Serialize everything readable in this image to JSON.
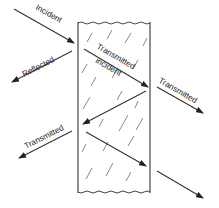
{
  "diagram": {
    "colors": {
      "line": "#333333",
      "text": "#222222",
      "background": "#ffffff"
    },
    "slab": {
      "x1": 78,
      "x2": 150,
      "top": 22,
      "bottom": 193
    },
    "labels": {
      "incident": "Incident",
      "reflected": "Reflected",
      "transmitted_incident_line1": "Transmitted",
      "transmitted_incident_line2": "incident",
      "transmitted_right": "Transmitted",
      "transmitted_left": "Transmitted"
    },
    "arrows": [
      {
        "name": "incident-ray",
        "from": [
          14,
          9
        ],
        "to": [
          74,
          43
        ]
      },
      {
        "name": "reflected-ray",
        "from": [
          72,
          51
        ],
        "to": [
          12,
          82
        ]
      },
      {
        "name": "transmitted-incident-ray",
        "from": [
          84,
          49
        ],
        "to": [
          148,
          87
        ]
      },
      {
        "name": "transmitted-right-ray",
        "from": [
          157,
          87
        ],
        "to": [
          203,
          113
        ]
      },
      {
        "name": "internal-reflected-ray",
        "from": [
          146,
          91
        ],
        "to": [
          83,
          124
        ]
      },
      {
        "name": "transmitted-left-ray",
        "from": [
          72,
          131
        ],
        "to": [
          19,
          158
        ]
      },
      {
        "name": "internal-second-ray",
        "from": [
          86,
          132
        ],
        "to": [
          146,
          166
        ]
      },
      {
        "name": "transmitted-bottom-ray",
        "from": [
          157,
          171
        ],
        "to": [
          203,
          198
        ]
      }
    ]
  }
}
